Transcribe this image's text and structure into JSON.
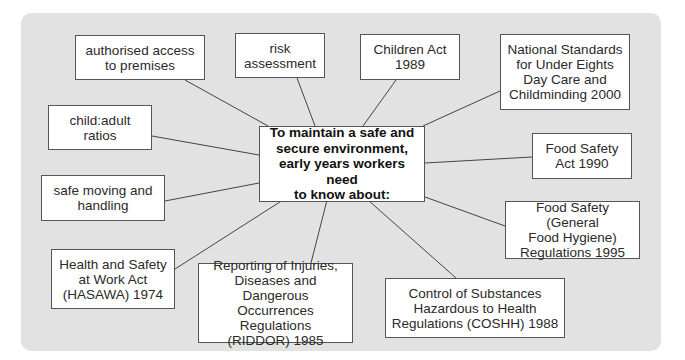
{
  "diagram": {
    "center": {
      "text": "To maintain a safe and\nsecure environment,\nearly years workers need\nto know about:",
      "box": [
        259,
        126,
        166,
        76
      ]
    },
    "nodes": [
      {
        "id": "authorised-access",
        "text": "authorised access\nto premises",
        "box": [
          75,
          35,
          130,
          45
        ],
        "line": [
          [
            185,
            80
          ],
          [
            268,
            126
          ]
        ]
      },
      {
        "id": "risk-assessment",
        "text": "risk\nassessment",
        "box": [
          235,
          33,
          90,
          45
        ],
        "line": [
          [
            297,
            78
          ],
          [
            315,
            126
          ]
        ]
      },
      {
        "id": "children-act",
        "text": "Children Act\n1989",
        "box": [
          360,
          34,
          100,
          46
        ],
        "line": [
          [
            396,
            80
          ],
          [
            363,
            126
          ]
        ]
      },
      {
        "id": "national-standards",
        "text": "National Standards\nfor Under Eights\nDay Care and\nChildminding 2000",
        "box": [
          500,
          34,
          130,
          76
        ],
        "line": [
          [
            500,
            91
          ],
          [
            423,
            126
          ]
        ]
      },
      {
        "id": "child-adult-ratios",
        "text": "child:adult\nratios",
        "box": [
          48,
          105,
          104,
          45
        ],
        "line": [
          [
            152,
            136
          ],
          [
            259,
            155
          ]
        ]
      },
      {
        "id": "food-safety-act",
        "text": "Food Safety\nAct 1990",
        "box": [
          532,
          133,
          100,
          46
        ],
        "line": [
          [
            532,
            157
          ],
          [
            425,
            163
          ]
        ]
      },
      {
        "id": "safe-moving",
        "text": "safe moving and\nhandling",
        "box": [
          41,
          175,
          124,
          46
        ],
        "line": [
          [
            165,
            201
          ],
          [
            259,
            183
          ]
        ]
      },
      {
        "id": "food-safety-general",
        "text": "Food Safety (General\nFood Hygiene)\nRegulations 1995",
        "box": [
          505,
          201,
          135,
          58
        ],
        "line": [
          [
            505,
            226
          ],
          [
            425,
            197
          ]
        ]
      },
      {
        "id": "hasawa",
        "text": "Health and Safety\nat Work Act\n(HASAWA) 1974",
        "box": [
          51,
          249,
          124,
          60
        ],
        "line": [
          [
            175,
            269
          ],
          [
            283,
            200
          ]
        ]
      },
      {
        "id": "riddor",
        "text": "Reporting of Injuries,\nDiseases and Dangerous\nOccurrences Regulations\n(RIDDOR) 1985",
        "box": [
          198,
          263,
          155,
          80
        ],
        "line": [
          [
            311,
            263
          ],
          [
            327,
            200
          ]
        ]
      },
      {
        "id": "coshh",
        "text": "Control of Substances\nHazardous to Health\nRegulations (COSHH) 1988",
        "box": [
          385,
          278,
          180,
          60
        ],
        "line": [
          [
            456,
            278
          ],
          [
            368,
            200
          ]
        ]
      }
    ],
    "colors": {
      "panel_bg": "#e2e2e2",
      "box_bg": "#ffffff",
      "box_border": "#555555",
      "line": "#444444",
      "text": "#2a2a2a"
    }
  }
}
